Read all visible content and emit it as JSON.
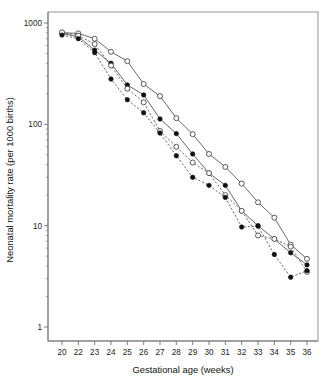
{
  "chart_data": {
    "type": "line",
    "title": "",
    "subtitle": "",
    "xlabel": "Gestational age (weeks)",
    "ylabel": "Neonatal mortality rate (per 1000 births)",
    "categories": [
      "20",
      "22",
      "23",
      "24",
      "25",
      "26",
      "27",
      "28",
      "29",
      "30",
      "31",
      "32",
      "33",
      "34",
      "35",
      "36"
    ],
    "xtick_labels": [
      "20",
      "22",
      "23",
      "24",
      "25",
      "26",
      "27",
      "28",
      "29",
      "30",
      "31",
      "32",
      "33",
      "34",
      "35",
      "36"
    ],
    "ytick_labels": [
      "1000",
      "100",
      "10",
      "1"
    ],
    "ytick_values": [
      1000,
      100,
      10,
      1
    ],
    "ylim": [
      1,
      1400
    ],
    "yscale": "log",
    "xscale": "categorical",
    "grid": false,
    "legend": "none",
    "series": [
      {
        "name": "series-1-open-solid",
        "marker": "open-circle",
        "linestyle": "solid",
        "values": [
          800,
          790,
          700,
          520,
          420,
          250,
          190,
          115,
          80,
          51,
          38,
          26,
          17,
          12,
          6.5,
          4.7
        ]
      },
      {
        "name": "series-2-filled-solid",
        "marker": "filled-circle",
        "linestyle": "solid",
        "values": [
          790,
          730,
          540,
          400,
          245,
          195,
          113,
          81,
          51,
          33,
          25,
          14,
          10,
          7.4,
          5.4,
          4.1
        ]
      },
      {
        "name": "series-3-open-dashed",
        "marker": "open-circle",
        "linestyle": "dashed",
        "values": [
          810,
          750,
          620,
          380,
          225,
          165,
          86,
          60,
          42,
          33,
          20,
          14,
          8,
          7.4,
          6.2,
          3.5
        ]
      },
      {
        "name": "series-4-filled-dashed",
        "marker": "filled-circle",
        "linestyle": "dashed",
        "values": [
          760,
          700,
          510,
          280,
          175,
          130,
          82,
          49,
          30,
          25,
          19,
          9.7,
          9.9,
          5.2,
          3.1,
          3.6
        ]
      }
    ]
  }
}
